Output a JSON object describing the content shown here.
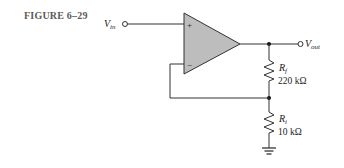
{
  "figure": {
    "title": "FIGURE 6–29"
  },
  "circuit": {
    "type": "non-inverting amplifier",
    "input": {
      "label": "V",
      "sub": "in"
    },
    "output": {
      "label": "V",
      "sub": "out"
    },
    "opamp": {
      "plus": "+",
      "minus": "−",
      "fill": "#bdbdbd"
    },
    "rf": {
      "label": "R",
      "sub": "f",
      "value": "220 kΩ"
    },
    "ri": {
      "label": "R",
      "sub": "i",
      "value": "10 kΩ"
    }
  }
}
